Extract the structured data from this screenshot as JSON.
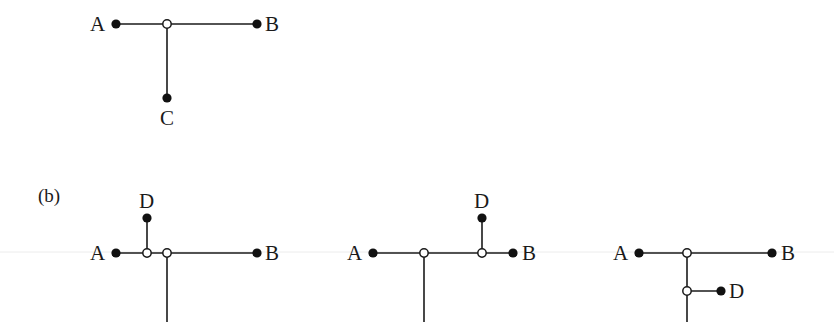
{
  "figure": {
    "panel_b_label": "(b)"
  },
  "top_tree": {
    "labels": {
      "a": "A",
      "b": "B",
      "c": "C"
    }
  },
  "panel_b": [
    {
      "labels": {
        "a": "A",
        "b": "B",
        "d": "D"
      },
      "description": "D attached via new Steiner point on edge A-junction"
    },
    {
      "labels": {
        "a": "A",
        "b": "B",
        "d": "D"
      },
      "description": "D attached via new Steiner point on edge junction-B"
    },
    {
      "labels": {
        "a": "A",
        "b": "B",
        "d": "D"
      },
      "description": "D attached via new Steiner point on edge junction-C"
    }
  ],
  "colors": {
    "line": "#1a1a1a",
    "terminal_fill": "#111111",
    "steiner_fill": "#ffffff"
  }
}
